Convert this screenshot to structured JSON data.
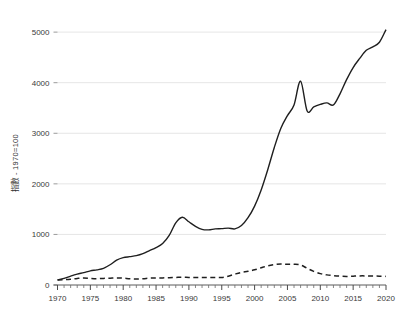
{
  "chart_data": {
    "type": "line",
    "title": "",
    "subtitle": "",
    "xlabel": "",
    "ylabel": "指數 - 1970=100",
    "xlim": [
      1970,
      2020
    ],
    "ylim": [
      0,
      5200
    ],
    "grid": "horizontal",
    "legend": "none",
    "x_ticks_major": [
      1970,
      1975,
      1980,
      1985,
      1990,
      1995,
      2000,
      2005,
      2010,
      2015,
      2020
    ],
    "x_tick_labels": [
      "1970",
      "1975",
      "1980",
      "1985",
      "1990",
      "1995",
      "2000",
      "2005",
      "2010",
      "2015",
      "2020"
    ],
    "x_minor_tick_step": 1,
    "y_ticks": [
      0,
      1000,
      2000,
      3000,
      4000,
      5000
    ],
    "y_tick_labels": [
      "0",
      "1000",
      "2000",
      "3000",
      "4000",
      "5000"
    ],
    "x": [
      1970,
      1971,
      1972,
      1973,
      1974,
      1975,
      1976,
      1977,
      1978,
      1979,
      1980,
      1981,
      1982,
      1983,
      1984,
      1985,
      1986,
      1987,
      1988,
      1989,
      1990,
      1991,
      1992,
      1993,
      1994,
      1995,
      1996,
      1997,
      1998,
      1999,
      2000,
      2001,
      2002,
      2003,
      2004,
      2005,
      2006,
      2007,
      2008,
      2009,
      2010,
      2011,
      2012,
      2013,
      2014,
      2015,
      2016,
      2017,
      2018,
      2019,
      2020
    ],
    "series": [
      {
        "name": "solid-series",
        "style": "solid",
        "color": "#1f1f1f",
        "values": [
          100,
          130,
          175,
          215,
          245,
          280,
          300,
          330,
          400,
          490,
          540,
          560,
          580,
          620,
          680,
          740,
          820,
          980,
          1230,
          1340,
          1250,
          1160,
          1100,
          1090,
          1110,
          1115,
          1125,
          1110,
          1175,
          1330,
          1560,
          1880,
          2280,
          2720,
          3100,
          3350,
          3560,
          4030,
          3440,
          3520,
          3570,
          3600,
          3560,
          3780,
          4060,
          4300,
          4480,
          4640,
          4710,
          4800,
          5050
        ]
      },
      {
        "name": "dashed-series",
        "style": "dashed",
        "color": "#1f1f1f",
        "values": [
          100,
          105,
          115,
          130,
          140,
          130,
          125,
          130,
          135,
          140,
          135,
          125,
          120,
          125,
          135,
          140,
          140,
          145,
          150,
          155,
          150,
          150,
          150,
          150,
          150,
          150,
          175,
          215,
          250,
          270,
          300,
          340,
          380,
          405,
          415,
          410,
          410,
          395,
          330,
          270,
          225,
          200,
          185,
          175,
          170,
          175,
          180,
          180,
          178,
          175,
          170
        ]
      }
    ]
  }
}
